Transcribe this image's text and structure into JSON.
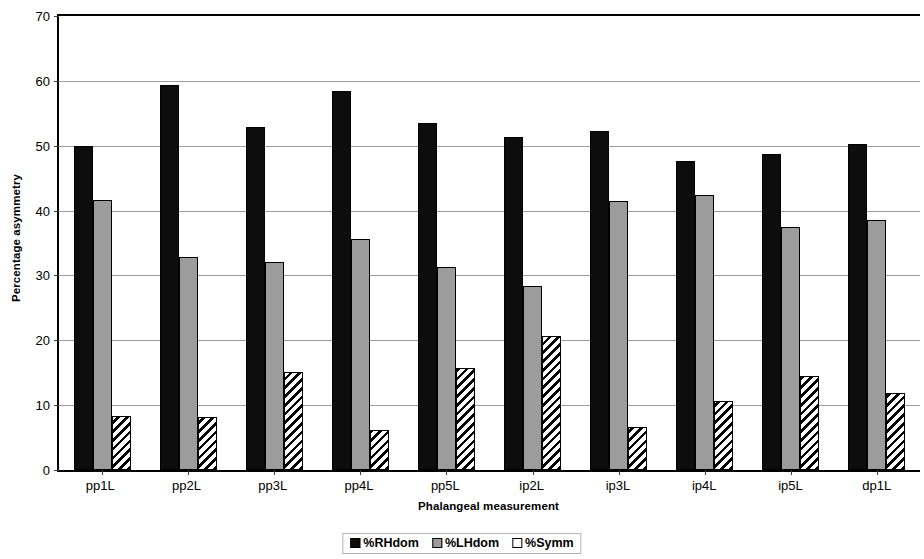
{
  "chart_data": {
    "type": "bar",
    "title": "",
    "xlabel": "Phalangeal measurement",
    "ylabel": "Percentage asymmetry",
    "ylim": [
      0,
      70
    ],
    "ytick_values": [
      0,
      10,
      20,
      30,
      40,
      50,
      60,
      70
    ],
    "ytick_labels": [
      "0",
      "10",
      "20",
      "30",
      "40",
      "50",
      "60",
      "70"
    ],
    "grid": true,
    "legend_position": "bottom-center",
    "categories": [
      "pp1L",
      "pp2L",
      "pp3L",
      "pp4L",
      "pp5L",
      "ip2L",
      "ip3L",
      "ip4L",
      "ip5L",
      "dp1L"
    ],
    "series": [
      {
        "name": "%RHdom",
        "color": "#0d0d0d",
        "pattern": "solid",
        "values": [
          50.0,
          59.4,
          52.9,
          58.4,
          53.5,
          51.4,
          52.3,
          47.6,
          48.8,
          50.3
        ]
      },
      {
        "name": "%LHdom",
        "color": "#9c9c9c",
        "pattern": "solid",
        "values": [
          41.7,
          32.8,
          32.1,
          35.6,
          31.3,
          28.4,
          41.5,
          42.4,
          37.4,
          38.5
        ]
      },
      {
        "name": "%Symm",
        "color": "#ffffff",
        "pattern": "diagonal-hatch",
        "values": [
          8.4,
          8.1,
          15.1,
          6.2,
          15.7,
          20.6,
          6.6,
          10.6,
          14.5,
          11.8
        ]
      }
    ]
  },
  "axes": {
    "y_title": "Percentage asymmetry",
    "x_title": "Phalangeal measurement"
  },
  "legend": {
    "items": [
      {
        "label": "%RHdom",
        "swatch": "rhdom"
      },
      {
        "label": "%LHdom",
        "swatch": "lhdom"
      },
      {
        "label": "%Symm",
        "swatch": "symm"
      }
    ]
  }
}
